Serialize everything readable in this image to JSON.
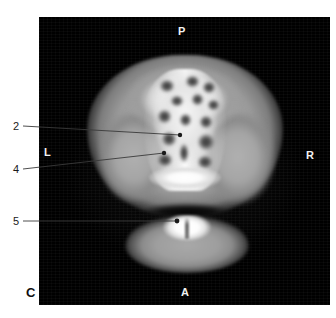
{
  "figure": {
    "corner_label": "C",
    "panel": {
      "background_color": "#000000",
      "modality_view": "coronal-ct-slice"
    }
  },
  "orientation_markers": [
    {
      "id": "posterior",
      "label": "P",
      "position": "top"
    },
    {
      "id": "left",
      "label": "L",
      "position": "left"
    },
    {
      "id": "right",
      "label": "R",
      "position": "right"
    },
    {
      "id": "anterior",
      "label": "A",
      "position": "bottom"
    }
  ],
  "callouts": [
    {
      "id": "callout-2",
      "label": "2",
      "label_x": 13,
      "label_y": 121,
      "line_start_x": 23,
      "line_start_y": 126,
      "target_x": 180,
      "target_y": 135
    },
    {
      "id": "callout-4",
      "label": "4",
      "label_x": 13,
      "label_y": 164,
      "line_start_x": 23,
      "line_start_y": 169,
      "target_x": 164,
      "target_y": 153
    },
    {
      "id": "callout-5",
      "label": "5",
      "label_x": 13,
      "label_y": 216,
      "line_start_x": 23,
      "line_start_y": 221,
      "target_x": 177,
      "target_y": 221
    }
  ],
  "colors": {
    "page_background": "#ffffff",
    "panel_background": "#000000",
    "marker_text": "#f2f2f2",
    "callout_text": "#1a1a1a",
    "leader_line": "#3a3a3a"
  }
}
